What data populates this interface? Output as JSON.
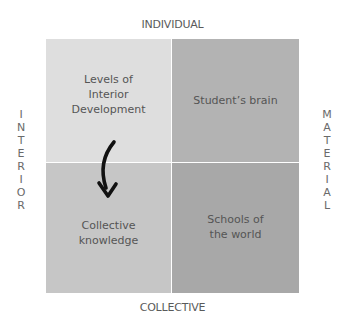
{
  "axes": {
    "top": "INDIVIDUAL",
    "bottom": "COLLECTIVE",
    "left": [
      "I",
      "N",
      "T",
      "E",
      "R",
      "I",
      "O",
      "R"
    ],
    "right": [
      "M",
      "A",
      "T",
      "E",
      "R",
      "I",
      "A",
      "L"
    ]
  },
  "quadrants": {
    "top_left": "Levels of\nInterior\nDevelopment",
    "top_right": "Student’s brain",
    "bottom_left": "Collective\nknowledge",
    "bottom_right": "Schools of\nthe world"
  },
  "colors": {
    "top_left": "#dedede",
    "top_right": "#b3b3b3",
    "bottom_left": "#c6c6c6",
    "bottom_right": "#a8a8a8",
    "arrow": "#111111"
  },
  "arrow": {
    "from": "top_left",
    "to": "bottom_left"
  }
}
